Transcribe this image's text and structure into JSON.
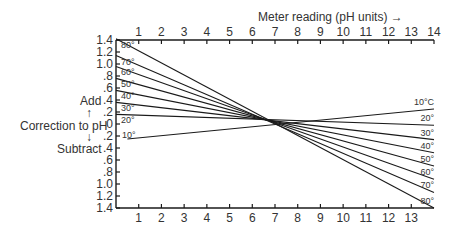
{
  "chart_data": {
    "type": "line",
    "title": "",
    "xlabel": "Meter reading (pH units)",
    "xlabel_arrow": "→",
    "ylabel": "Correction to pH",
    "ylabel_add": "Add",
    "ylabel_subtract": "Subtract",
    "x_ticks_top": [
      "1",
      "2",
      "3",
      "4",
      "5",
      "6",
      "7",
      "8",
      "9",
      "10",
      "11",
      "12",
      "13",
      "14"
    ],
    "x_ticks_bottom": [
      "1",
      "2",
      "3",
      "4",
      "5",
      "6",
      "7",
      "8",
      "9",
      "10",
      "11",
      "12",
      "13"
    ],
    "y_ticks": [
      "1.4",
      "1.2",
      "1.0",
      ".8",
      ".6",
      ".4",
      ".2",
      "0",
      ".2",
      ".4",
      ".6",
      ".8",
      "1.0",
      "1.2",
      "1.4"
    ],
    "xlim": [
      0,
      14
    ],
    "ylim": [
      -1.4,
      1.4
    ],
    "grid": false,
    "series": [
      {
        "name": "80°",
        "right_label": "80°",
        "x": [
          0,
          14
        ],
        "y": [
          1.42,
          -1.4
        ]
      },
      {
        "name": "70°",
        "right_label": "70°",
        "x": [
          0,
          14
        ],
        "y": [
          1.14,
          -1.14
        ]
      },
      {
        "name": "60°",
        "right_label": "60°",
        "x": [
          0,
          14
        ],
        "y": [
          0.96,
          -0.92
        ]
      },
      {
        "name": "50°",
        "right_label": "50°",
        "x": [
          0,
          14
        ],
        "y": [
          0.76,
          -0.7
        ]
      },
      {
        "name": "40°",
        "right_label": "40°",
        "x": [
          0,
          14
        ],
        "y": [
          0.56,
          -0.48
        ]
      },
      {
        "name": "30°",
        "right_label": "30°",
        "x": [
          0,
          14
        ],
        "y": [
          0.36,
          -0.26
        ]
      },
      {
        "name": "20°",
        "right_label": "20°",
        "x": [
          0,
          14
        ],
        "y": [
          0.16,
          -0.02
        ]
      },
      {
        "name": "10°",
        "right_label": "10°C",
        "x": [
          0.5,
          14
        ],
        "y": [
          -0.25,
          0.25
        ]
      }
    ]
  }
}
